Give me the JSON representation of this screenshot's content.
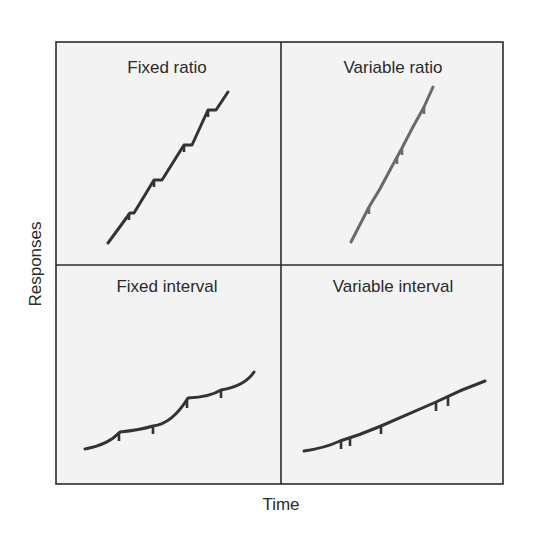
{
  "figure": {
    "xlabel": "Time",
    "ylabel": "Responses",
    "colors": {
      "panel_background": "#f3f3f3",
      "frame": "#2b2b2b",
      "fixed_curve": "#333333",
      "variable_curve": "#6a6a6a"
    },
    "panels": [
      {
        "id": "fixed-ratio",
        "title": "Fixed ratio",
        "description": "steep line with brief pauses (steps) after each reinforcement",
        "reinforcement_marks": 4
      },
      {
        "id": "variable-ratio",
        "title": "Variable ratio",
        "description": "steep steady line with irregular reinforcement marks",
        "reinforcement_marks": 4
      },
      {
        "id": "fixed-interval",
        "title": "Fixed interval",
        "description": "scalloped curve rising slowly with reinforcement at regular intervals",
        "reinforcement_marks": 4
      },
      {
        "id": "variable-interval",
        "title": "Variable interval",
        "description": "gradual steady slope with irregular reinforcement marks",
        "reinforcement_marks": 5
      }
    ]
  }
}
